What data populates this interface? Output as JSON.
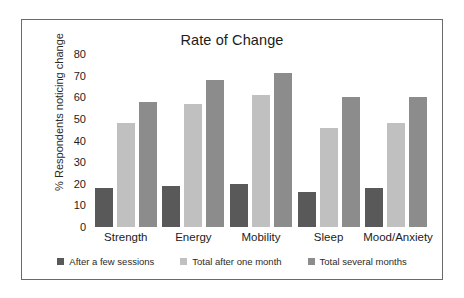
{
  "chart_data": {
    "type": "bar",
    "title": "Rate of Change",
    "xlabel": "",
    "ylabel": "% Respondents noticing change",
    "ylim": [
      0,
      80
    ],
    "yticks": [
      "0",
      "10",
      "20",
      "30",
      "40",
      "50",
      "60",
      "70",
      "80"
    ],
    "grid": false,
    "legend_position": "bottom",
    "categories": [
      "Strength",
      "Energy",
      "Mobility",
      "Sleep",
      "Mood/Anxiety"
    ],
    "series": [
      {
        "name": "After a few sessions",
        "color": "#595959",
        "values": [
          18,
          19,
          20,
          16,
          18
        ]
      },
      {
        "name": "Total after one month",
        "color": "#c0c0c0",
        "values": [
          48,
          57,
          61,
          46,
          48
        ]
      },
      {
        "name": "Total several months",
        "color": "#8c8c8c",
        "values": [
          58,
          68,
          71,
          60,
          60
        ]
      }
    ]
  },
  "frame": {
    "border_color": "#6a6a6a",
    "background": "#ffffff"
  }
}
